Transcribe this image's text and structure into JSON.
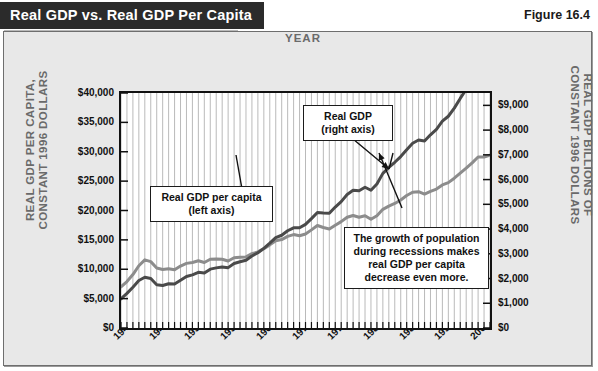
{
  "header": {
    "title": "Real GDP vs. Real GDP Per Capita",
    "figure_number": "Figure 16.4"
  },
  "chart_data": {
    "type": "line",
    "title": "Real GDP vs. Real GDP Per Capita",
    "xlabel": "YEAR",
    "ylabel_left": "REAL GDP PER CAPITA, CONSTANT 1996 DOLLARS",
    "ylabel_right": "REAL GDP BILLIONS OF CONSTANT 1996 DOLLARS",
    "grid": "vertical annual gridlines",
    "legend_position": "inline callout boxes",
    "xlim": [
      1940,
      2002
    ],
    "xticks": [
      "1940",
      "1946",
      "1952",
      "1958",
      "1964",
      "1970",
      "1976",
      "1982",
      "1988",
      "1994",
      "2000"
    ],
    "xtick_values": [
      1940,
      1946,
      1952,
      1958,
      1964,
      1970,
      1976,
      1982,
      1988,
      1994,
      2000
    ],
    "ylim_left": [
      0,
      40000
    ],
    "yticks_left": [
      "$0",
      "$5,000",
      "$10,000",
      "$15,000",
      "$20,000",
      "$25,000",
      "$30,000",
      "$35,000",
      "$40,000"
    ],
    "ytick_values_left": [
      0,
      5000,
      10000,
      15000,
      20000,
      25000,
      30000,
      35000,
      40000
    ],
    "ylim_right": [
      0,
      9500
    ],
    "yticks_right": [
      "$0",
      "$1,000",
      "$2,000",
      "$3,000",
      "$4,000",
      "$5,000",
      "$6,000",
      "$7,000",
      "$8,000",
      "$9,000"
    ],
    "ytick_values_right": [
      0,
      1000,
      2000,
      3000,
      4000,
      5000,
      6000,
      7000,
      8000,
      9000
    ],
    "x": [
      1940,
      1941,
      1942,
      1943,
      1944,
      1945,
      1946,
      1947,
      1948,
      1949,
      1950,
      1951,
      1952,
      1953,
      1954,
      1955,
      1956,
      1957,
      1958,
      1959,
      1960,
      1961,
      1962,
      1963,
      1964,
      1965,
      1966,
      1967,
      1968,
      1969,
      1970,
      1971,
      1972,
      1973,
      1974,
      1975,
      1976,
      1977,
      1978,
      1979,
      1980,
      1981,
      1982,
      1983,
      1984,
      1985,
      1986,
      1987,
      1988,
      1989,
      1990,
      1991,
      1992,
      1993,
      1994,
      1995,
      1996,
      1997,
      1998,
      1999,
      2000,
      2001,
      2002
    ],
    "series": [
      {
        "name": "Real GDP per capita (left axis)",
        "axis": "left",
        "color": "#8c8c8c",
        "units": "Constant 1996 dollars",
        "values": [
          7000,
          7900,
          9100,
          10600,
          11600,
          11300,
          10200,
          9950,
          10100,
          9900,
          10550,
          11000,
          11150,
          11450,
          11150,
          11700,
          11750,
          11700,
          11400,
          11950,
          12050,
          12100,
          12650,
          12950,
          13500,
          14150,
          14850,
          15050,
          15600,
          15900,
          15700,
          16000,
          16700,
          17450,
          17100,
          16850,
          17500,
          18100,
          18850,
          19150,
          18850,
          19100,
          18500,
          19100,
          20200,
          20750,
          21200,
          21800,
          22550,
          23100,
          23200,
          22800,
          23250,
          23650,
          24350,
          24750,
          25500,
          26350,
          27200,
          28100,
          29100,
          29100,
          29400
        ],
        "approx_note": "values read from left axis gridlines"
      },
      {
        "name": "Real GDP (right axis)",
        "axis": "right",
        "color": "#4a4a4a",
        "units": "Billions of constant 1996 dollars",
        "values": [
          1180,
          1400,
          1650,
          1920,
          2050,
          2000,
          1750,
          1720,
          1790,
          1780,
          1930,
          2080,
          2150,
          2250,
          2220,
          2380,
          2430,
          2470,
          2440,
          2610,
          2680,
          2740,
          2910,
          3040,
          3220,
          3430,
          3650,
          3750,
          3930,
          4050,
          4050,
          4190,
          4420,
          4670,
          4650,
          4640,
          4890,
          5110,
          5400,
          5570,
          5550,
          5690,
          5570,
          5820,
          6250,
          6490,
          6700,
          6930,
          7210,
          7470,
          7600,
          7560,
          7810,
          8030,
          8360,
          8560,
          8890,
          9280,
          9650,
          10000,
          10350,
          10400,
          10600
        ],
        "approx_note": "values read from right axis gridlines"
      }
    ],
    "annotations": [
      {
        "name": "per-capita-callout",
        "text_lines": [
          "Real GDP per capita",
          "(left axis)"
        ]
      },
      {
        "name": "real-gdp-callout",
        "text_lines": [
          "Real GDP",
          "(right axis)"
        ]
      },
      {
        "name": "population-growth-callout",
        "text_lines": [
          "The growth of population",
          "during recessions makes",
          "real GDP per capita",
          "decrease even more."
        ]
      }
    ]
  },
  "colors": {
    "title_bar_bg": "#2b2b2b",
    "title_bar_text": "#ffffff",
    "panel_bg": "#e8e8e8",
    "plot_bg": "#ffffff",
    "gridline": "#a8a8a8",
    "axis_label": "#6a6a6a",
    "series_per_capita": "#8c8c8c",
    "series_real_gdp": "#4a4a4a"
  }
}
